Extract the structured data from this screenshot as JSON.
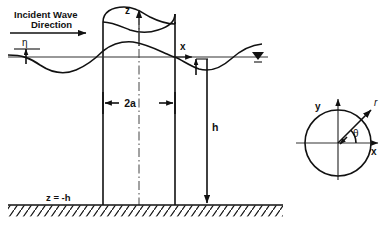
{
  "figure": {
    "type": "engineering-schematic",
    "background_color": "#ffffff",
    "line_color": "#111111",
    "axis_color": "#333333"
  },
  "elevation_view": {
    "incident_wave_label_line1": "Incident Wave",
    "incident_wave_label_line2": "Direction",
    "eta_label": "η",
    "z_axis_label": "z",
    "x_axis_label": "x",
    "diameter_label": "2a",
    "depth_label": "h",
    "seabed_label": "z = -h",
    "still_water_level_symbol": "∇"
  },
  "plan_view": {
    "x_axis_label": "x",
    "y_axis_label": "y",
    "radial_label": "r",
    "angle_label": "θ"
  },
  "geometry": {
    "waterline_y": 57,
    "seabed_y": 205,
    "cylinder_left_x": 103,
    "cylinder_right_x": 175,
    "cylinder_top_y": 20,
    "cylinder_axis_x": 139,
    "plan_circle_center_x": 338,
    "plan_circle_center_y": 143,
    "plan_circle_radius": 33
  }
}
